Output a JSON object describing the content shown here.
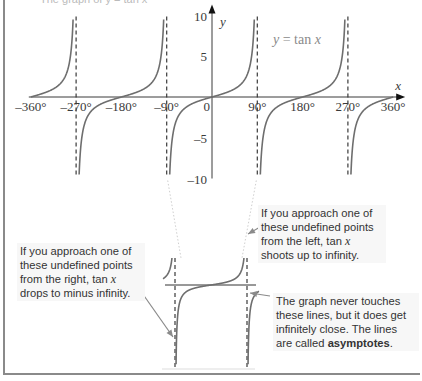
{
  "page": {
    "cropped_heading": "The graph of y = tan x"
  },
  "chart_data": {
    "type": "line",
    "title": "",
    "function_label": "y = tan x",
    "function_label_parts": {
      "y": "y",
      "eq": " = tan ",
      "x": "x"
    },
    "xlabel": "x",
    "ylabel": "y",
    "x_unit": "degrees",
    "xlim": [
      -360,
      360
    ],
    "ylim": [
      -10,
      10
    ],
    "x_ticks": [
      -360,
      -270,
      -180,
      -90,
      0,
      90,
      180,
      270,
      360
    ],
    "x_tick_labels": [
      "–360°",
      "–270°",
      "–180°",
      "–90°",
      "0",
      "90°",
      "180°",
      "270°",
      "360°"
    ],
    "y_ticks": [
      10,
      5,
      -5,
      -10
    ],
    "y_tick_labels": [
      "10",
      "5",
      "–5",
      "–10"
    ],
    "asymptotes_x": [
      -270,
      -90,
      90,
      270
    ],
    "asymptote_style": "dashed",
    "series": [
      {
        "name": "y = tan x",
        "x": [
          -360,
          -330,
          -315,
          -300,
          -285,
          -280,
          -275,
          -270,
          -265,
          -260,
          -255,
          -240,
          -225,
          -210,
          -180,
          -150,
          -135,
          -120,
          -105,
          -100,
          -95,
          -90,
          -85,
          -80,
          -75,
          -60,
          -45,
          -30,
          0,
          30,
          45,
          60,
          75,
          80,
          85,
          90,
          95,
          100,
          105,
          120,
          135,
          150,
          180,
          210,
          225,
          240,
          255,
          260,
          265,
          270,
          275,
          280,
          285,
          300,
          315,
          330,
          360
        ],
        "values": [
          0,
          0.577,
          1,
          1.732,
          3.732,
          5.671,
          10,
          null,
          -10,
          -5.671,
          -3.732,
          -1.732,
          -1,
          -0.577,
          0,
          0.577,
          1,
          1.732,
          3.732,
          5.671,
          10,
          null,
          -10,
          -5.671,
          -3.732,
          -1.732,
          -1,
          -0.577,
          0,
          0.577,
          1,
          1.732,
          3.732,
          5.671,
          10,
          null,
          -10,
          -5.671,
          -3.732,
          -1.732,
          -1,
          -0.577,
          0,
          0.577,
          1,
          1.732,
          3.732,
          5.671,
          10,
          null,
          -10,
          -5.671,
          -3.732,
          -1.732,
          -1,
          -0.577,
          0
        ]
      }
    ],
    "grid": false,
    "legend": "none",
    "inset": {
      "description": "Magnified view of one period between asymptotes at x = -90° and x = 90°",
      "asymptotes_x": [
        -90,
        90
      ],
      "horizontal_line": "y = 0"
    },
    "annotations": [
      "If you approach one of these undefined points from the left, tan x shoots up to infinity.",
      "If you approach one of these undefined points from the right, tan x drops to minus infinity.",
      "The graph never touches these lines, but it does get infinitely close. The lines are called asymptotes."
    ]
  },
  "callouts": {
    "from_left": {
      "text_before": "If you approach one of these undefined points from the left, ",
      "tan": "tan ",
      "x": "x",
      "text_after": " shoots up to infinity."
    },
    "from_right": {
      "text_before": "If you approach one of these undefined points from the right, ",
      "tan": "tan ",
      "x": "x",
      "text_after": " drops to minus infinity."
    },
    "asymptotes": {
      "text_before": "The graph never touches these lines, but it does get infinitely close.  The lines are called ",
      "bold": "asymptotes",
      "text_after": "."
    }
  },
  "colors": {
    "curve": "#6e6e6e",
    "axis": "#3a3a3a",
    "asymptote": "#3a3a3a",
    "frame": "#8a8a8a",
    "label_gray": "#8a8a8a",
    "callout_bg": "#f7f7f7",
    "arrow": "#8a8a8a"
  }
}
